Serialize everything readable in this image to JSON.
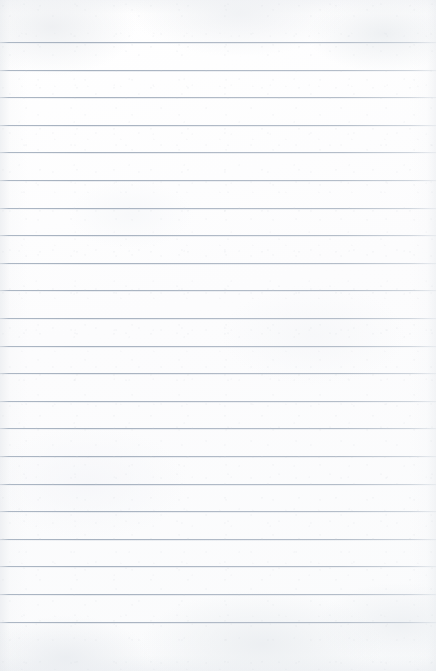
{
  "document": {
    "type": "lined-paper",
    "title": "Blank lined notebook page",
    "content_text": "",
    "paper_color": "#fdfdfd",
    "rule_color": "#a6b1bf",
    "page_width": 436,
    "page_height": 671,
    "line_count": 22,
    "first_line_y": 42,
    "line_spacing": 27.6,
    "last_line_y": 622,
    "top_margin": 42,
    "bottom_margin": 49,
    "left_margin": 0,
    "right_margin": 0,
    "has_margin_rule": false,
    "has_holes": false,
    "lines": [
      {
        "index": 1,
        "y": 42,
        "text": ""
      },
      {
        "index": 2,
        "y": 70,
        "text": ""
      },
      {
        "index": 3,
        "y": 97,
        "text": ""
      },
      {
        "index": 4,
        "y": 125,
        "text": ""
      },
      {
        "index": 5,
        "y": 152,
        "text": ""
      },
      {
        "index": 6,
        "y": 180,
        "text": ""
      },
      {
        "index": 7,
        "y": 208,
        "text": ""
      },
      {
        "index": 8,
        "y": 235,
        "text": ""
      },
      {
        "index": 9,
        "y": 263,
        "text": ""
      },
      {
        "index": 10,
        "y": 290,
        "text": ""
      },
      {
        "index": 11,
        "y": 318,
        "text": ""
      },
      {
        "index": 12,
        "y": 346,
        "text": ""
      },
      {
        "index": 13,
        "y": 373,
        "text": ""
      },
      {
        "index": 14,
        "y": 401,
        "text": ""
      },
      {
        "index": 15,
        "y": 428,
        "text": ""
      },
      {
        "index": 16,
        "y": 456,
        "text": ""
      },
      {
        "index": 17,
        "y": 484,
        "text": ""
      },
      {
        "index": 18,
        "y": 511,
        "text": ""
      },
      {
        "index": 19,
        "y": 539,
        "text": ""
      },
      {
        "index": 20,
        "y": 566,
        "text": ""
      },
      {
        "index": 21,
        "y": 594,
        "text": ""
      },
      {
        "index": 22,
        "y": 622,
        "text": ""
      }
    ]
  }
}
